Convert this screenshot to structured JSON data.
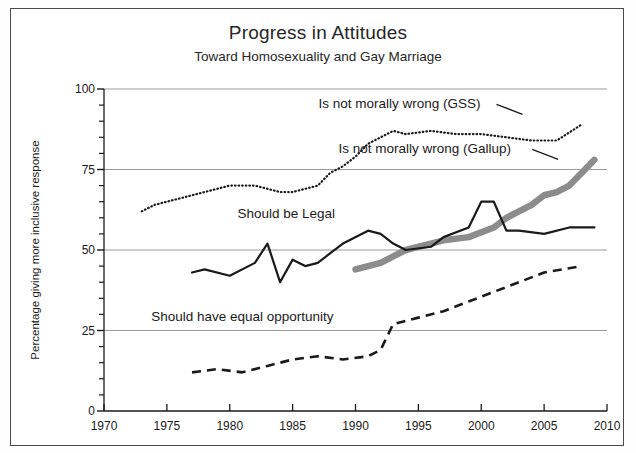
{
  "chart_data": {
    "type": "line",
    "title": "Progress in Attitudes",
    "subtitle": "Toward Homosexuality and Gay Marriage",
    "xlabel": "",
    "ylabel": "Percentage giving more inclusive response",
    "xlim": [
      1970,
      2010
    ],
    "ylim": [
      0,
      100
    ],
    "xticks": [
      1970,
      1975,
      1980,
      1985,
      1990,
      1995,
      2000,
      2005,
      2010
    ],
    "xtick_labels": [
      "1970",
      "1975",
      "1980",
      "1985",
      "1990",
      "1995",
      "2000",
      "2005",
      "2010"
    ],
    "yticks": [
      0,
      25,
      50,
      75,
      100
    ],
    "ytick_labels": [
      "0",
      "25",
      "50",
      "75",
      "100"
    ],
    "minor_tick_step": 5,
    "grid": "horizontal-major",
    "grid_color": "#9a9a9a",
    "legend_position": "inline-annotations",
    "series": [
      {
        "name": "Is not morally wrong (GSS)",
        "style": "dotted",
        "color": "#1a1a1a",
        "x": [
          1973,
          1974,
          1976,
          1977,
          1980,
          1982,
          1984,
          1985,
          1987,
          1988,
          1989,
          1990,
          1991,
          1993,
          1994,
          1996,
          1998,
          2000,
          2002,
          2004,
          2006,
          2008
        ],
        "values": [
          62,
          64,
          66,
          67,
          70,
          70,
          68,
          68,
          70,
          74,
          76,
          79,
          83,
          87,
          86,
          87,
          86,
          86,
          85,
          84,
          84,
          89
        ]
      },
      {
        "name": "Is not morally wrong (Gallup)",
        "style": "thick-gray",
        "color": "#8c8c8c",
        "x": [
          1990,
          1992,
          1993,
          1994,
          1996,
          1997,
          1999,
          2001,
          2002,
          2003,
          2004,
          2005,
          2006,
          2007,
          2008,
          2009
        ],
        "values": [
          44,
          46,
          48,
          50,
          52,
          53,
          54,
          57,
          60,
          62,
          64,
          67,
          68,
          70,
          74,
          78
        ]
      },
      {
        "name": "Should be Legal",
        "style": "solid-black",
        "color": "#1a1a1a",
        "x": [
          1977,
          1978,
          1980,
          1982,
          1983,
          1984,
          1985,
          1986,
          1987,
          1988,
          1989,
          1991,
          1992,
          1993,
          1994,
          1996,
          1997,
          1999,
          2000,
          2001,
          2002,
          2003,
          2005,
          2007,
          2009
        ],
        "values": [
          43,
          44,
          42,
          46,
          52,
          40,
          47,
          45,
          46,
          49,
          52,
          56,
          55,
          52,
          50,
          51,
          54,
          57,
          65,
          65,
          56,
          56,
          55,
          57,
          57
        ]
      },
      {
        "name": "Should have equal opportunity",
        "style": "dashed",
        "color": "#1a1a1a",
        "x": [
          1977,
          1979,
          1981,
          1983,
          1985,
          1987,
          1989,
          1991,
          1992,
          1993,
          1995,
          1997,
          1999,
          2001,
          2003,
          2005,
          2008
        ],
        "values": [
          12,
          13,
          12,
          14,
          16,
          17,
          16,
          17,
          19,
          27,
          29,
          31,
          34,
          37,
          40,
          43,
          45
        ]
      }
    ],
    "annotations": [
      {
        "text": "Is not morally wrong (GSS)",
        "x": 1993.5,
        "y": 94,
        "leader": true
      },
      {
        "text": "Is not morally wrong (Gallup)",
        "x": 1995.5,
        "y": 80,
        "leader": true
      },
      {
        "text": "Should be Legal",
        "x": 1984.5,
        "y": 60,
        "leader": false
      },
      {
        "text": "Should have equal opportunity",
        "x": 1981.0,
        "y": 28,
        "leader": false
      }
    ]
  },
  "axis": {
    "y_title": "Percentage giving more inclusive response"
  }
}
